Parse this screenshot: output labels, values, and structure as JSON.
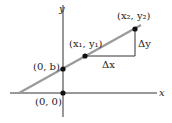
{
  "diagram": {
    "axes": {
      "x_label": "x",
      "y_label": "y"
    },
    "points": [
      {
        "label": "(0, 0)",
        "name": "origin"
      },
      {
        "label": "(0, b)",
        "name": "y-intercept"
      },
      {
        "label": "(x₁, y₁)",
        "name": "point-1"
      },
      {
        "label": "(x₂, y₂)",
        "name": "point-2"
      }
    ],
    "delta_x": "Δx",
    "delta_y": "Δy",
    "colors": {
      "line": "#9a9a9a",
      "axis": "#333333",
      "point": "#111111"
    }
  }
}
